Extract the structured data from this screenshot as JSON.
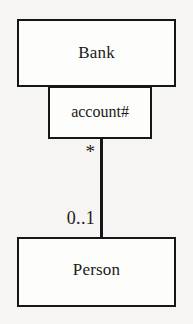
{
  "diagram": {
    "type": "uml-class-diagram",
    "notation": "qualified association",
    "background_color": "#f6f5f3",
    "line_color": "#161616",
    "fill_color": "#fdfdfc"
  },
  "classes": [
    {
      "id": "bank",
      "name": "Bank"
    },
    {
      "id": "person",
      "name": "Person"
    }
  ],
  "qualifier": {
    "label": "account#",
    "attached_to": "Bank"
  },
  "association": {
    "source": "Bank",
    "target": "Person",
    "source_multiplicity": "*",
    "target_multiplicity": "0..1"
  }
}
